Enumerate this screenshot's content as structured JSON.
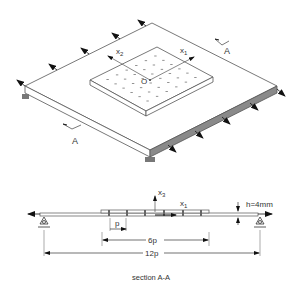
{
  "labels": {
    "axis_x1_top": "x",
    "axis_x1_top_sub": "1",
    "axis_x2_top": "x",
    "axis_x2_top_sub": "2",
    "origin": "O",
    "section_mark_right": "A",
    "section_mark_left": "A",
    "axis_x3_sec": "x",
    "axis_x3_sec_sub": "3",
    "axis_x1_sec": "x",
    "axis_x1_sec_sub": "1",
    "thickness": "h=4mm",
    "pitch": "p",
    "span_6p": "6p",
    "span_12p": "12p",
    "caption": "section A-A"
  },
  "colors": {
    "line": "#555555",
    "arrow": "#111111",
    "shade": "#8a8a8a",
    "support": "#777777"
  }
}
